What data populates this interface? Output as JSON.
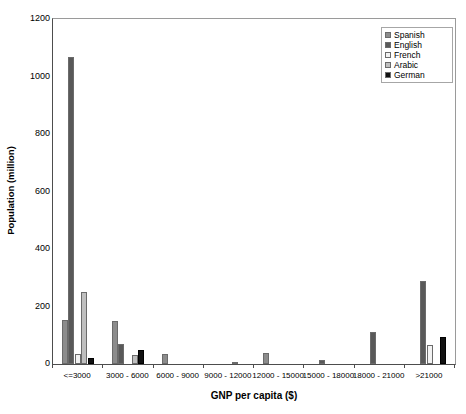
{
  "chart_data": {
    "type": "bar",
    "title": "",
    "xlabel": "GNP per capita ($)",
    "ylabel": "Population (million)",
    "ylim": [
      0,
      1200
    ],
    "ytick_step": 200,
    "ytick_labels": [
      "0",
      "200",
      "400",
      "600",
      "800",
      "1000",
      "1200"
    ],
    "grid": false,
    "legend_position": "top-right",
    "categories": [
      "<=3000",
      "3000 - 6000",
      "6000 - 9000",
      "9000 - 12000",
      "12000 - 15000",
      "15000 - 18000",
      "18000 - 21000",
      ">21000"
    ],
    "series": [
      {
        "name": "Spanish",
        "color": "#8c8c8c",
        "values": [
          153,
          150,
          35,
          0,
          40,
          0,
          0,
          0
        ]
      },
      {
        "name": "English",
        "color": "#595959",
        "values": [
          1068,
          70,
          0,
          0,
          0,
          15,
          110,
          290
        ]
      },
      {
        "name": "French",
        "color": "#f2f2f2",
        "values": [
          35,
          0,
          0,
          0,
          0,
          0,
          0,
          65
        ]
      },
      {
        "name": "Arabic",
        "color": "#bfbfbf",
        "values": [
          250,
          30,
          0,
          5,
          0,
          0,
          0,
          0
        ]
      },
      {
        "name": "German",
        "color": "#111111",
        "values": [
          20,
          50,
          0,
          0,
          0,
          0,
          0,
          95
        ]
      }
    ]
  },
  "legend": {
    "entries": [
      {
        "label": "Spanish",
        "color": "#8c8c8c"
      },
      {
        "label": "English",
        "color": "#595959"
      },
      {
        "label": "French",
        "color": "#f2f2f2"
      },
      {
        "label": "Arabic",
        "color": "#bfbfbf"
      },
      {
        "label": "German",
        "color": "#111111"
      }
    ]
  },
  "axes": {
    "y_title": "Population (million)",
    "x_title": "GNP per capita ($)"
  }
}
